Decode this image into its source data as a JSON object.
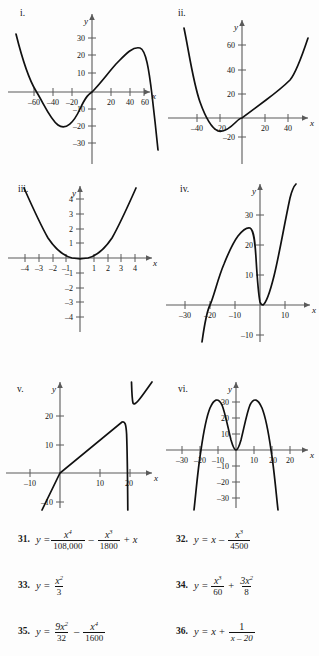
{
  "page": {
    "background": "#fdfdfd",
    "ink": "#111111",
    "axis_color": "#5a5a5a",
    "curve_color": "#111111"
  },
  "graphs": [
    {
      "label": "i.",
      "axis_label_x": "x",
      "axis_label_y": "y",
      "xticks": [
        "-60",
        "-40",
        "-20",
        "20",
        "40",
        "60"
      ],
      "yticks": [
        "30",
        "20",
        "10",
        "-10",
        "-20",
        "-30"
      ],
      "equation_ref": "31",
      "curve_type": "quartic",
      "description": "quartic rising on left, dips to about -26 near x=-38, crosses origin, peaks near 26 at x=40, falls steeply after x=68"
    },
    {
      "label": "ii.",
      "axis_label_x": "x",
      "axis_label_y": "y",
      "xticks": [
        "-40",
        "-20",
        "20",
        "40"
      ],
      "yticks": [
        "60",
        "40",
        "20",
        "-20"
      ],
      "equation_ref": "32",
      "curve_type": "cubic",
      "description": "steep descent from upper left, minimum about -15 near x=-24, through origin, gentle rise then steeper climb to 60"
    },
    {
      "label": "iii.",
      "axis_label_x": "x",
      "axis_label_y": "y",
      "xticks": [
        "-4",
        "-3",
        "-2",
        "-1",
        "1",
        "2",
        "3",
        "4"
      ],
      "yticks": [
        "4",
        "3",
        "2",
        "1",
        "-1",
        "-2",
        "-3",
        "-4"
      ],
      "equation_ref": "33",
      "curve_type": "parabola",
      "description": "upward parabola vertex at origin, passes near (4, 5.3), flat bottom"
    },
    {
      "label": "iv.",
      "axis_label_x": "x",
      "axis_label_y": "y",
      "xticks": [
        "-30",
        "-20",
        "-10",
        "10"
      ],
      "yticks": [
        "30",
        "20",
        "10",
        "-10"
      ],
      "equation_ref": "34",
      "curve_type": "cubic",
      "description": "rises from below left crossing x near -22, local max about 28 at x=-14, dips to touch zero at origin, then rises steeply"
    },
    {
      "label": "v.",
      "axis_label_x": "x",
      "axis_label_y": "y",
      "xticks": [
        "-10",
        "10",
        "20"
      ],
      "yticks": [
        "20",
        "10",
        "-10"
      ],
      "equation_ref": "36",
      "curve_type": "rational",
      "description": "slanted line y=x with vertical asymptote at x=20; left branch rises to about 18 then plunges, right branch drops from high then rises"
    },
    {
      "label": "vi.",
      "axis_label_x": "x",
      "axis_label_y": "y",
      "xticks": [
        "-30",
        "-20",
        "-10",
        "10",
        "20"
      ],
      "yticks": [
        "30",
        "20",
        "10",
        "-10",
        "-20",
        "-30"
      ],
      "equation_ref": "35",
      "curve_type": "quartic",
      "description": "W-inverted shape: two peaks near 32 at x=-15 and x=15, local min touching zero at origin, steep falls outside x=±21"
    }
  ],
  "exercises": [
    {
      "number": "31.",
      "lhs": "y =",
      "terms": [
        {
          "kind": "frac",
          "num_base": "x",
          "num_exp": "4",
          "den": "108,000"
        },
        {
          "kind": "op",
          "text": "–"
        },
        {
          "kind": "frac",
          "num_base": "x",
          "num_exp": "3",
          "den": "1800"
        },
        {
          "kind": "op",
          "text": "+"
        },
        {
          "kind": "var",
          "text": "x"
        }
      ]
    },
    {
      "number": "32.",
      "lhs": "y =",
      "terms": [
        {
          "kind": "var",
          "text": "x"
        },
        {
          "kind": "op",
          "text": "–"
        },
        {
          "kind": "frac",
          "num_base": "x",
          "num_exp": "3",
          "den": "4500"
        }
      ]
    },
    {
      "number": "33.",
      "lhs": "y =",
      "terms": [
        {
          "kind": "frac",
          "num_base": "x",
          "num_exp": "2",
          "den": "3"
        }
      ]
    },
    {
      "number": "34.",
      "lhs": "y =",
      "terms": [
        {
          "kind": "frac",
          "num_base": "x",
          "num_exp": "3",
          "den": "60"
        },
        {
          "kind": "op",
          "text": "+"
        },
        {
          "kind": "frac",
          "num_base": "3x",
          "num_exp": "2",
          "den": "8"
        }
      ]
    },
    {
      "number": "35.",
      "lhs": "y =",
      "terms": [
        {
          "kind": "frac",
          "num_base": "9x",
          "num_exp": "2",
          "den": "32"
        },
        {
          "kind": "op",
          "text": "–"
        },
        {
          "kind": "frac",
          "num_base": "x",
          "num_exp": "4",
          "den": "1600"
        }
      ]
    },
    {
      "number": "36.",
      "lhs": "y =",
      "terms": [
        {
          "kind": "var",
          "text": "x"
        },
        {
          "kind": "op",
          "text": "+"
        },
        {
          "kind": "frac_plain",
          "num": "1",
          "den": "x – 20"
        }
      ]
    }
  ]
}
